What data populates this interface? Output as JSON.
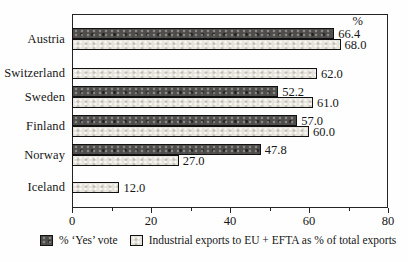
{
  "chart_data": {
    "type": "bar",
    "orientation": "horizontal",
    "unit_header": "%",
    "xlim": [
      0,
      80
    ],
    "xticks": [
      0,
      20,
      40,
      60,
      80
    ],
    "minor_xticks": [
      10,
      30,
      50,
      70
    ],
    "grid": false,
    "legend_position": "bottom",
    "categories": [
      "Austria",
      "Switzerland",
      "Sweden",
      "Finland",
      "Norway",
      "Iceland"
    ],
    "series": [
      {
        "name": "% ‘Yes’ vote",
        "swatch": "dark",
        "color": "#4f4d4b",
        "values": [
          66.4,
          null,
          52.2,
          57.0,
          47.8,
          null
        ],
        "labels": [
          "66.4",
          null,
          "52.2",
          "57.0",
          "47.8",
          null
        ]
      },
      {
        "name": "Industrial exports to EU + EFTA as % of total exports",
        "swatch": "light",
        "color": "#e5e3db",
        "values": [
          68.0,
          62.0,
          61.0,
          60.0,
          27.0,
          12.0
        ],
        "labels": [
          "68.0",
          "62.0",
          "61.0",
          "60.0",
          "27.0",
          "12.0"
        ]
      }
    ]
  }
}
